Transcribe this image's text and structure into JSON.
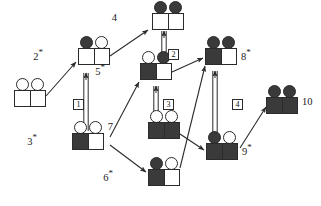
{
  "diagram": {
    "colors": {
      "dark": "#3a3a3a",
      "outline": "#2b2b2b",
      "light": "#ffffff"
    },
    "nodes": [
      {
        "id": "1",
        "label": "1",
        "starred": false,
        "label_side": "left",
        "x": 14,
        "y": 90,
        "circle_left": "light",
        "circle_right": "light",
        "square_left": "light",
        "square_right": "light"
      },
      {
        "id": "2",
        "label": "2",
        "starred": true,
        "label_side": "left",
        "x": 78,
        "y": 48,
        "circle_left": "dark",
        "circle_right": "light",
        "square_left": "light",
        "square_right": "light"
      },
      {
        "id": "3",
        "label": "3",
        "starred": true,
        "label_side": "left",
        "x": 72,
        "y": 133,
        "circle_left": "light",
        "circle_right": "light",
        "square_left": "dark",
        "square_right": "light"
      },
      {
        "id": "4",
        "label": "4",
        "starred": false,
        "label_side": "left",
        "x": 152,
        "y": 13,
        "circle_left": "dark",
        "circle_right": "dark",
        "square_left": "light",
        "square_right": "light"
      },
      {
        "id": "5",
        "label": "5",
        "starred": true,
        "label_side": "left",
        "x": 140,
        "y": 63,
        "circle_left": "light",
        "circle_right": "dark",
        "square_left": "dark",
        "square_right": "light"
      },
      {
        "id": "6",
        "label": "6",
        "starred": true,
        "label_side": "left",
        "x": 148,
        "y": 169,
        "circle_left": "dark",
        "circle_right": "light",
        "square_left": "dark",
        "square_right": "light"
      },
      {
        "id": "7",
        "label": "7",
        "starred": false,
        "label_side": "left",
        "x": 148,
        "y": 122,
        "circle_left": "light",
        "circle_right": "light",
        "square_left": "dark",
        "square_right": "dark"
      },
      {
        "id": "8",
        "label": "8",
        "starred": true,
        "label_side": "right",
        "x": 205,
        "y": 48,
        "circle_left": "dark",
        "circle_right": "dark",
        "square_left": "dark",
        "square_right": "light"
      },
      {
        "id": "9",
        "label": "9",
        "starred": true,
        "label_side": "right",
        "x": 206,
        "y": 143,
        "circle_left": "dark",
        "circle_right": "light",
        "square_left": "dark",
        "square_right": "dark"
      },
      {
        "id": "10",
        "label": "10",
        "starred": false,
        "label_side": "right",
        "x": 266,
        "y": 97,
        "circle_left": "dark",
        "circle_right": "dark",
        "square_left": "dark",
        "square_right": "dark"
      }
    ],
    "edge_labels": [
      {
        "id": "edge-label-1",
        "text": "1",
        "x": 73,
        "y": 99
      },
      {
        "id": "edge-label-2",
        "text": "2",
        "x": 168,
        "y": 49
      },
      {
        "id": "edge-label-3",
        "text": "3",
        "x": 163,
        "y": 99
      },
      {
        "id": "edge-label-4",
        "text": "4",
        "x": 232,
        "y": 99
      }
    ],
    "double_edges": [
      {
        "id": "double-edge-3-to-2",
        "from": "3",
        "to": "2",
        "x": 86,
        "y1": 131,
        "y2": 73
      },
      {
        "id": "double-edge-5-to-4",
        "from": "5",
        "to": "4",
        "x": 164,
        "y1": 62,
        "y2": 31
      },
      {
        "id": "double-edge-7-to-5",
        "from": "7",
        "to": "5",
        "x": 156,
        "y1": 121,
        "y2": 86
      },
      {
        "id": "double-edge-9-to-8",
        "from": "9",
        "to": "8",
        "x": 215,
        "y1": 141,
        "y2": 71
      }
    ],
    "arrow_edges": [
      {
        "id": "arrow-1-to-2",
        "from": "1",
        "to": "2",
        "x1": 46,
        "y1": 96,
        "x2": 76,
        "y2": 62
      },
      {
        "id": "arrow-2-to-4",
        "from": "2",
        "to": "4",
        "x1": 110,
        "y1": 56,
        "x2": 148,
        "y2": 30
      },
      {
        "id": "arrow-3-to-5",
        "from": "3",
        "to": "5",
        "x1": 110,
        "y1": 137,
        "x2": 139,
        "y2": 82
      },
      {
        "id": "arrow-3-to-6",
        "from": "3",
        "to": "6",
        "x1": 110,
        "y1": 145,
        "x2": 146,
        "y2": 172
      },
      {
        "id": "arrow-5-to-8",
        "from": "5",
        "to": "8",
        "x1": 172,
        "y1": 72,
        "x2": 203,
        "y2": 58
      },
      {
        "id": "arrow-6-to-8",
        "from": "6",
        "to": "8",
        "x1": 180,
        "y1": 168,
        "x2": 205,
        "y2": 66
      },
      {
        "id": "arrow-7-to-9",
        "from": "7",
        "to": "9",
        "x1": 180,
        "y1": 134,
        "x2": 204,
        "y2": 150
      },
      {
        "id": "arrow-9-to-10",
        "from": "9",
        "to": "10",
        "x1": 240,
        "y1": 148,
        "x2": 266,
        "y2": 107
      }
    ]
  }
}
